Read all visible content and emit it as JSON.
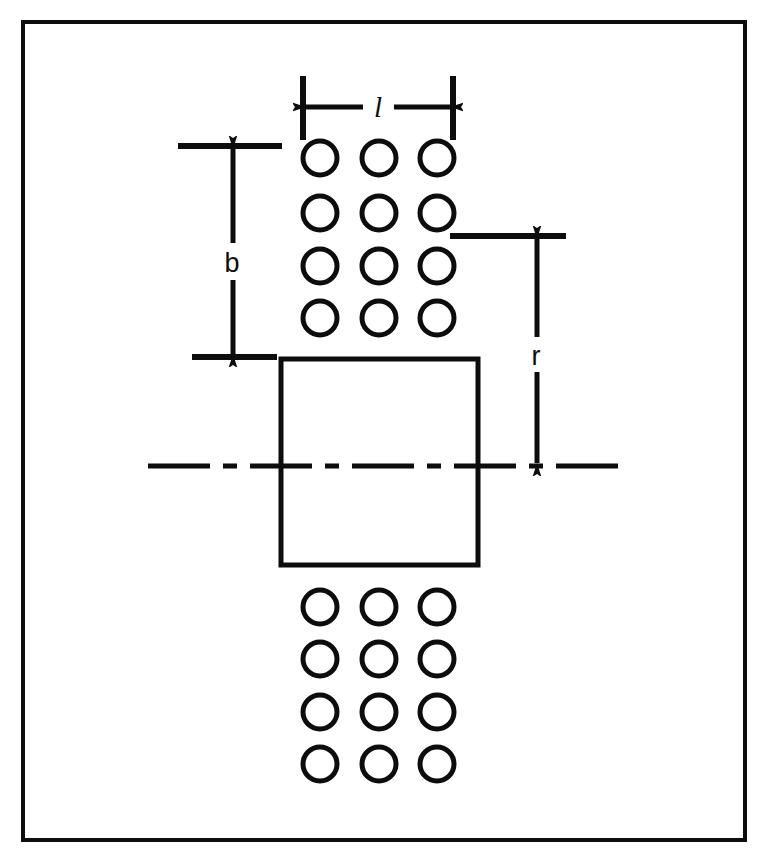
{
  "figure": {
    "background_color": "#ffffff",
    "ink_color": "#0d0d0d",
    "frame": {
      "name": "figure-border",
      "x": 23,
      "y": 22,
      "width": 722,
      "height": 818,
      "stroke_width": 4
    },
    "labels": {
      "pitch": "l",
      "edge_distance": "b",
      "radius": "r"
    },
    "plate": {
      "x": 281,
      "y": 359,
      "width": 197,
      "height": 206,
      "stroke_width": 5
    },
    "centerline": {
      "y": 466,
      "x_start": 148,
      "x_end": 620,
      "pattern": "dash-dot",
      "stroke_width": 5
    },
    "hole_grids": [
      {
        "name": "upper-hole-grid",
        "columns": 3,
        "rows": 4,
        "column_x": [
          320,
          379,
          437
        ],
        "row_y": [
          158,
          213,
          266,
          318
        ],
        "radius": 17,
        "stroke_width": 5
      },
      {
        "name": "lower-hole-grid",
        "columns": 3,
        "rows": 4,
        "column_x": [
          320,
          379,
          437
        ],
        "row_y": [
          607,
          659,
          712,
          764
        ],
        "radius": 17,
        "stroke_width": 5
      }
    ],
    "dimensions": [
      {
        "name": "pitch-dimension",
        "label": "l",
        "orientation": "horizontal",
        "line_y": 107,
        "x_start": 303,
        "x_end": 453,
        "label_x": 378,
        "label_y": 104,
        "extension_lines": [
          {
            "x": 303,
            "y_start": 76,
            "y_end": 140
          },
          {
            "x": 453,
            "y_start": 76,
            "y_end": 140
          }
        ]
      },
      {
        "name": "edge-distance-dimension",
        "label": "b",
        "orientation": "vertical",
        "line_x": 233,
        "y_start": 146,
        "y_end": 357,
        "label_x": 232,
        "label_y": 262,
        "extension_lines": [
          {
            "y": 146,
            "x_start": 178,
            "x_end": 282
          },
          {
            "y": 357,
            "x_start": 192,
            "x_end": 277
          }
        ]
      },
      {
        "name": "radius-dimension",
        "label": "r",
        "orientation": "vertical",
        "line_x": 537,
        "y_start": 236,
        "y_end": 466,
        "label_x": 536,
        "label_y": 355,
        "extension_lines": [
          {
            "y": 236,
            "x_start": 450,
            "x_end": 566
          }
        ]
      }
    ]
  }
}
